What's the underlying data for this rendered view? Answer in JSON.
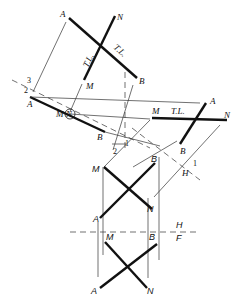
{
  "diagram": {
    "views": {
      "aux2": {
        "A": "A",
        "N": "N",
        "M": "M",
        "B": "B",
        "tl1": "T.L.",
        "tl2": "T.L."
      },
      "aux1": {
        "A": "A",
        "B": "B",
        "M": "M",
        "N": "N"
      },
      "aux1b": {
        "M": "M",
        "tl": "T.L.",
        "A": "A",
        "N": "N",
        "B": "B"
      },
      "top": {
        "M": "M",
        "B": "B",
        "A": "A",
        "N": "N"
      },
      "front": {
        "M": "M",
        "B": "B",
        "A": "A",
        "N": "N"
      }
    },
    "fold_lines": {
      "hf_top": "H",
      "hf_bottom": "F",
      "h1_h": "H",
      "h1_1": "1",
      "f12_1": "1",
      "f12_2": "2",
      "f23_2": "2",
      "f23_3": "3"
    }
  }
}
